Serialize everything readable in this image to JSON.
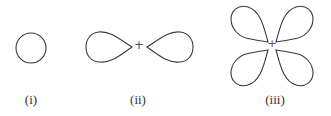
{
  "diagram": {
    "type": "atomic orbital shapes",
    "stroke_color": "#3a3a3a",
    "figures": [
      {
        "id": "i",
        "label": "(i)",
        "shape": "circle",
        "lobes": 1,
        "nucleus_marker": ""
      },
      {
        "id": "ii",
        "label": "(ii)",
        "shape": "dumbbell",
        "lobes": 2,
        "nucleus_marker": "+"
      },
      {
        "id": "iii",
        "label": "(iii)",
        "shape": "cloverleaf",
        "lobes": 4,
        "nucleus_marker": "+"
      }
    ]
  }
}
